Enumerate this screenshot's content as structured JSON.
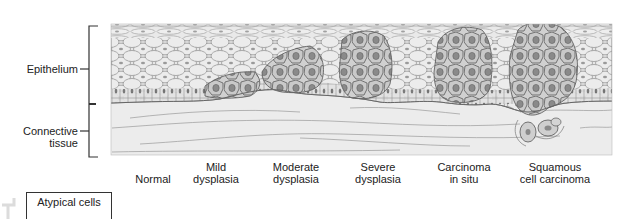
{
  "figure": {
    "side_labels": {
      "epithelium": "Epithelium",
      "connective_tissue_line1": "Connective",
      "connective_tissue_line2": "tissue"
    },
    "stages": [
      {
        "line1": "",
        "line2": "Normal"
      },
      {
        "line1": "Mild",
        "line2": "dysplasia"
      },
      {
        "line1": "Moderate",
        "line2": "dysplasia"
      },
      {
        "line1": "Severe",
        "line2": "dysplasia"
      },
      {
        "line1": "Carcinoma",
        "line2": "in situ"
      },
      {
        "line1": "Squamous",
        "line2": "cell carcinoma"
      }
    ],
    "legend": {
      "title": "Atypical cells"
    },
    "colors": {
      "epithelium_fill": "#e4e4e4",
      "cell_outline": "#8a8a8a",
      "atypical_fill": "#bdbdbd",
      "atypical_outline": "#555555",
      "connective_fill": "#ececec",
      "fiber_line": "#9a9a9a",
      "bracket": "#333333"
    }
  }
}
